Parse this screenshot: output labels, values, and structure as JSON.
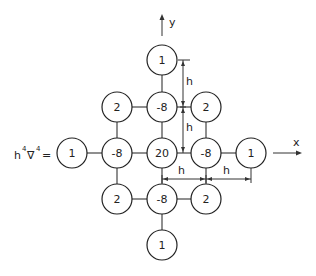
{
  "diagram": {
    "operator_label": {
      "h": "h",
      "h_exp": "4",
      "nabla": "∇",
      "nabla_exp": "4",
      "equals": "="
    },
    "axes": {
      "x_label": "x",
      "y_label": "y"
    },
    "spacing_label": "h",
    "nodes": [
      {
        "id": "top",
        "value": "1",
        "cx": 162,
        "cy": 60
      },
      {
        "id": "ul",
        "value": "2",
        "cx": 117,
        "cy": 107
      },
      {
        "id": "um",
        "value": "-8",
        "cx": 162,
        "cy": 107
      },
      {
        "id": "ur",
        "value": "2",
        "cx": 206,
        "cy": 107
      },
      {
        "id": "ll",
        "value": "1",
        "cx": 72,
        "cy": 153
      },
      {
        "id": "ml",
        "value": "-8",
        "cx": 117,
        "cy": 153
      },
      {
        "id": "c",
        "value": "20",
        "cx": 162,
        "cy": 153
      },
      {
        "id": "mr",
        "value": "-8",
        "cx": 206,
        "cy": 153
      },
      {
        "id": "rr",
        "value": "1",
        "cx": 251,
        "cy": 153
      },
      {
        "id": "dl",
        "value": "2",
        "cx": 117,
        "cy": 199
      },
      {
        "id": "dm",
        "value": "-8",
        "cx": 162,
        "cy": 199
      },
      {
        "id": "dr",
        "value": "2",
        "cx": 206,
        "cy": 199
      },
      {
        "id": "bottom",
        "value": "1",
        "cx": 162,
        "cy": 245
      }
    ]
  }
}
